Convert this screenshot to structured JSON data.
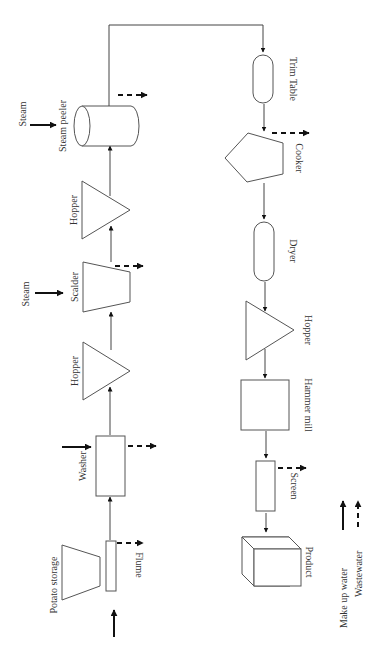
{
  "diagram": {
    "orientation": "rotated 90 degrees (read with page turned)",
    "units": [
      {
        "id": "flume",
        "label": "Flume"
      },
      {
        "id": "potato-storage",
        "label": "Potato storage"
      },
      {
        "id": "washer",
        "label": "Washer"
      },
      {
        "id": "hopper-1",
        "label": "Hopper"
      },
      {
        "id": "scalder",
        "label": "Scalder"
      },
      {
        "id": "hopper-2",
        "label": "Hopper"
      },
      {
        "id": "steam-peeler",
        "label": "Steam peeler"
      },
      {
        "id": "trim-table",
        "label": "Trim Table"
      },
      {
        "id": "cooker",
        "label": "Cooker"
      },
      {
        "id": "dryer",
        "label": "Dryer"
      },
      {
        "id": "hopper-3",
        "label": "Hopper"
      },
      {
        "id": "hammer-mill",
        "label": "Hammer mill"
      },
      {
        "id": "screen",
        "label": "Screen"
      },
      {
        "id": "product",
        "label": "Product"
      }
    ],
    "inputs": {
      "steam_scalder": "Steam",
      "steam_peeler": "Steam"
    },
    "legend": {
      "makeup_water": "Make up water",
      "wastewater": "Wastewater"
    },
    "flow": [
      "Flume",
      "Washer",
      "Hopper",
      "Scalder",
      "Hopper",
      "Steam peeler",
      "Trim Table",
      "Cooker",
      "Dryer",
      "Hopper",
      "Hammer mill",
      "Screen",
      "Product"
    ]
  }
}
